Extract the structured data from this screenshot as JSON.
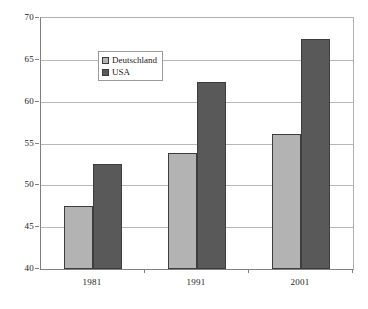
{
  "chart_data": {
    "type": "bar",
    "title": "",
    "subtitle": "",
    "xlabel": "",
    "ylabel": "",
    "categories": [
      "1981",
      "1991",
      "2001"
    ],
    "series": [
      {
        "name": "Deutschland",
        "color": "#b3b3b3",
        "values": [
          47.5,
          53.9,
          56.1
        ]
      },
      {
        "name": "USA",
        "color": "#595959",
        "values": [
          52.6,
          62.3,
          67.5
        ]
      }
    ],
    "ylim": [
      40,
      70
    ],
    "yticks": [
      40,
      45,
      50,
      55,
      60,
      65,
      70
    ],
    "ytick_labels": [
      "40",
      "45",
      "50",
      "55",
      "60",
      "65",
      "70"
    ],
    "grid": "horizontal",
    "legend_position": "inside-upper-left",
    "legend_entries": [
      "Deutschland",
      "USA"
    ],
    "annotations": []
  }
}
